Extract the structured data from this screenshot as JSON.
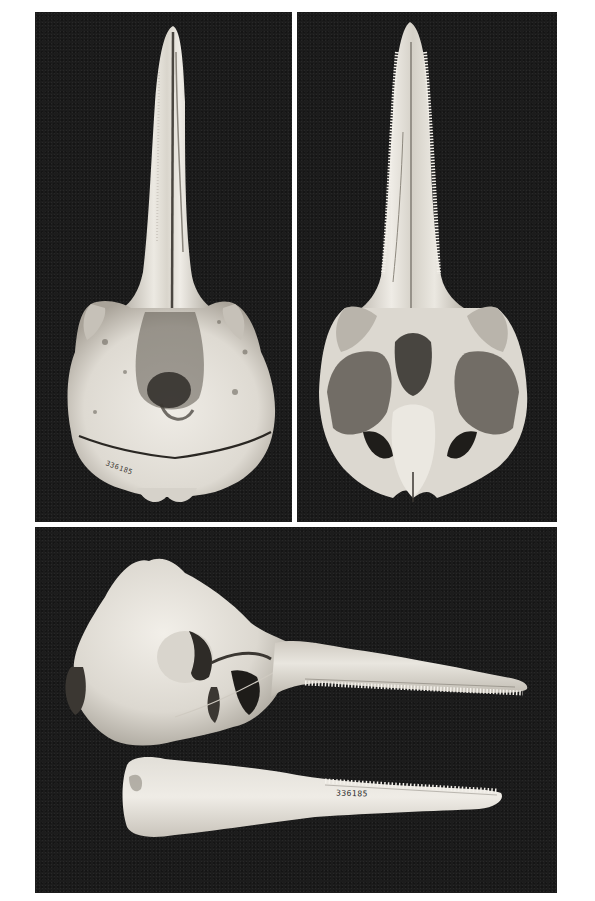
{
  "figure": {
    "panels": [
      {
        "id": "dorsal",
        "view": "dorsal view of cranium"
      },
      {
        "id": "ventral",
        "view": "ventral view of cranium"
      },
      {
        "id": "lateral",
        "view": "lateral view of cranium with mandible"
      }
    ],
    "specimen_number_cranium": "336185",
    "specimen_number_mandible": "336185"
  },
  "colors": {
    "background": "#ffffff",
    "panel_background": "#1c1c1c",
    "bone": "#e6e3dc",
    "bone_shadow": "#9c978e"
  }
}
